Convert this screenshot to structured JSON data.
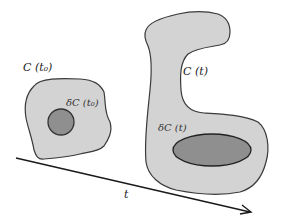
{
  "diagram": {
    "colors": {
      "background": "#ffffff",
      "region_fill": "#d3d3d3",
      "subregion_fill": "#8f8f8f",
      "stroke": "#3a3a3a",
      "arrow": "#1a1a1a"
    },
    "region_t0": {
      "label": "C (t₀)",
      "sublabel": "δC (t₀)"
    },
    "region_t": {
      "label": "C (t)",
      "sublabel": "δC (t)"
    },
    "time_axis": {
      "label": "t"
    }
  }
}
